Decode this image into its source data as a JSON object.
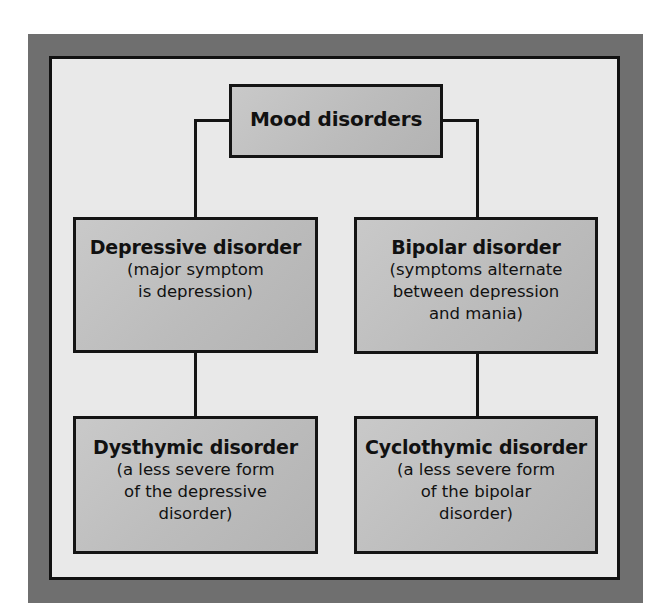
{
  "diagram": {
    "type": "hierarchy",
    "colors": {
      "frame": "#6f6f6f",
      "panel": "#e9e9e9",
      "node_fill": "#bdbdbd",
      "border": "#141414",
      "text": "#111111"
    },
    "root": {
      "title": "Mood disorders"
    },
    "level1": [
      {
        "title": "Depressive disorder",
        "desc_lines": [
          "(major symptom",
          "is depression)"
        ]
      },
      {
        "title": "Bipolar disorder",
        "desc_lines": [
          "(symptoms alternate",
          "between depression",
          "and mania)"
        ]
      }
    ],
    "level2": [
      {
        "title": "Dysthymic disorder",
        "desc_lines": [
          "(a less severe form",
          "of the depressive",
          "disorder)"
        ]
      },
      {
        "title": "Cyclothymic disorder",
        "desc_lines": [
          "(a less severe form",
          "of the bipolar",
          "disorder)"
        ]
      }
    ],
    "edges": [
      [
        "Mood disorders",
        "Depressive disorder"
      ],
      [
        "Mood disorders",
        "Bipolar disorder"
      ],
      [
        "Depressive disorder",
        "Dysthymic disorder"
      ],
      [
        "Bipolar disorder",
        "Cyclothymic disorder"
      ]
    ]
  }
}
